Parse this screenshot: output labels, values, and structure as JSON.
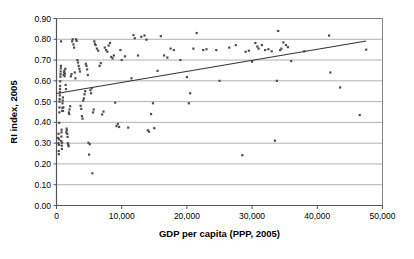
{
  "chart_data": {
    "type": "scatter",
    "title": "",
    "xlabel": "GDP per capita (PPP, 2005)",
    "ylabel": "RI index, 2005",
    "xlim": [
      0,
      50000
    ],
    "ylim": [
      0.0,
      0.9
    ],
    "xticks": [
      0,
      10000,
      20000,
      30000,
      40000,
      50000
    ],
    "xtick_labels": [
      "0",
      "10,000",
      "20,000",
      "30,000",
      "40,000",
      "50,000"
    ],
    "yticks": [
      0.0,
      0.1,
      0.2,
      0.3,
      0.4,
      0.5,
      0.6,
      0.7,
      0.8,
      0.9
    ],
    "ytick_labels": [
      "0.00",
      "0.10",
      "0.20",
      "0.30",
      "0.40",
      "0.50",
      "0.60",
      "0.70",
      "0.80",
      "0.90"
    ],
    "grid": "horizontal",
    "legend": "none",
    "marker": {
      "shape": "square",
      "size_px": 2.2,
      "color": "#4d4d4d"
    },
    "trendline": {
      "type": "linear",
      "color": "#333333",
      "x_start": 0,
      "y_start": 0.539,
      "x_end": 47500,
      "y_end": 0.792
    },
    "series": [
      {
        "name": "Countries",
        "points": [
          [
            250,
            0.325
          ],
          [
            300,
            0.3
          ],
          [
            320,
            0.345
          ],
          [
            340,
            0.262
          ],
          [
            360,
            0.247
          ],
          [
            380,
            0.292
          ],
          [
            400,
            0.318
          ],
          [
            420,
            0.398
          ],
          [
            440,
            0.448
          ],
          [
            450,
            0.472
          ],
          [
            470,
            0.5
          ],
          [
            480,
            0.512
          ],
          [
            500,
            0.53
          ],
          [
            520,
            0.545
          ],
          [
            540,
            0.56
          ],
          [
            560,
            0.575
          ],
          [
            580,
            0.598
          ],
          [
            600,
            0.62
          ],
          [
            620,
            0.632
          ],
          [
            640,
            0.645
          ],
          [
            660,
            0.66
          ],
          [
            680,
            0.672
          ],
          [
            700,
            0.79
          ],
          [
            720,
            0.31
          ],
          [
            740,
            0.332
          ],
          [
            760,
            0.352
          ],
          [
            780,
            0.365
          ],
          [
            800,
            0.288
          ],
          [
            820,
            0.272
          ],
          [
            850,
            0.302
          ],
          [
            880,
            0.455
          ],
          [
            900,
            0.47
          ],
          [
            920,
            0.492
          ],
          [
            950,
            0.505
          ],
          [
            980,
            0.52
          ],
          [
            1000,
            0.455
          ],
          [
            1050,
            0.472
          ],
          [
            1100,
            0.628
          ],
          [
            1150,
            0.64
          ],
          [
            1200,
            0.648
          ],
          [
            1250,
            0.622
          ],
          [
            1300,
            0.635
          ],
          [
            1350,
            0.658
          ],
          [
            1400,
            0.58
          ],
          [
            1450,
            0.56
          ],
          [
            1500,
            0.352
          ],
          [
            1550,
            0.37
          ],
          [
            1600,
            0.362
          ],
          [
            1650,
            0.345
          ],
          [
            1700,
            0.33
          ],
          [
            1750,
            0.3
          ],
          [
            1800,
            0.292
          ],
          [
            1850,
            0.285
          ],
          [
            1900,
            0.448
          ],
          [
            1950,
            0.44
          ],
          [
            2000,
            0.462
          ],
          [
            2100,
            0.478
          ],
          [
            2200,
            0.622
          ],
          [
            2300,
            0.632
          ],
          [
            2400,
            0.79
          ],
          [
            2500,
            0.8
          ],
          [
            2600,
            0.775
          ],
          [
            2700,
            0.76
          ],
          [
            2800,
            0.64
          ],
          [
            2900,
            0.612
          ],
          [
            3000,
            0.8
          ],
          [
            3100,
            0.792
          ],
          [
            3200,
            0.7
          ],
          [
            3300,
            0.688
          ],
          [
            3400,
            0.672
          ],
          [
            3500,
            0.658
          ],
          [
            3600,
            0.645
          ],
          [
            3700,
            0.48
          ],
          [
            3800,
            0.465
          ],
          [
            3900,
            0.43
          ],
          [
            4000,
            0.418
          ],
          [
            4100,
            0.505
          ],
          [
            4200,
            0.515
          ],
          [
            4300,
            0.535
          ],
          [
            4400,
            0.55
          ],
          [
            4500,
            0.682
          ],
          [
            4600,
            0.672
          ],
          [
            4700,
            0.655
          ],
          [
            4800,
            0.628
          ],
          [
            4900,
            0.302
          ],
          [
            5000,
            0.245
          ],
          [
            5100,
            0.295
          ],
          [
            5200,
            0.555
          ],
          [
            5300,
            0.54
          ],
          [
            5400,
            0.565
          ],
          [
            5500,
            0.155
          ],
          [
            5600,
            0.448
          ],
          [
            5700,
            0.462
          ],
          [
            5800,
            0.79
          ],
          [
            5900,
            0.778
          ],
          [
            6000,
            0.772
          ],
          [
            6200,
            0.755
          ],
          [
            6400,
            0.745
          ],
          [
            6600,
            0.672
          ],
          [
            6800,
            0.685
          ],
          [
            7000,
            0.438
          ],
          [
            7200,
            0.452
          ],
          [
            7400,
            0.76
          ],
          [
            7600,
            0.748
          ],
          [
            7800,
            0.74
          ],
          [
            8000,
            0.77
          ],
          [
            8200,
            0.782
          ],
          [
            8400,
            0.715
          ],
          [
            8600,
            0.708
          ],
          [
            8800,
            0.722
          ],
          [
            9000,
            0.495
          ],
          [
            9200,
            0.382
          ],
          [
            9400,
            0.392
          ],
          [
            9600,
            0.378
          ],
          [
            9800,
            0.748
          ],
          [
            10000,
            0.7
          ],
          [
            10500,
            0.718
          ],
          [
            11000,
            0.375
          ],
          [
            11500,
            0.612
          ],
          [
            11800,
            0.82
          ],
          [
            12000,
            0.805
          ],
          [
            12500,
            0.722
          ],
          [
            13000,
            0.812
          ],
          [
            13500,
            0.818
          ],
          [
            13800,
            0.798
          ],
          [
            14000,
            0.362
          ],
          [
            14200,
            0.355
          ],
          [
            14500,
            0.44
          ],
          [
            14800,
            0.492
          ],
          [
            15000,
            0.372
          ],
          [
            15500,
            0.648
          ],
          [
            16000,
            0.815
          ],
          [
            16500,
            0.722
          ],
          [
            17000,
            0.712
          ],
          [
            17500,
            0.755
          ],
          [
            18000,
            0.748
          ],
          [
            19000,
            0.7
          ],
          [
            20000,
            0.618
          ],
          [
            20300,
            0.492
          ],
          [
            20500,
            0.54
          ],
          [
            21000,
            0.755
          ],
          [
            21500,
            0.83
          ],
          [
            22500,
            0.748
          ],
          [
            23000,
            0.752
          ],
          [
            24500,
            0.748
          ],
          [
            25000,
            0.6
          ],
          [
            26500,
            0.76
          ],
          [
            27500,
            0.772
          ],
          [
            28500,
            0.242
          ],
          [
            29000,
            0.74
          ],
          [
            29500,
            0.745
          ],
          [
            30000,
            0.692
          ],
          [
            30500,
            0.782
          ],
          [
            30800,
            0.765
          ],
          [
            31000,
            0.755
          ],
          [
            31500,
            0.772
          ],
          [
            32000,
            0.748
          ],
          [
            32500,
            0.752
          ],
          [
            33000,
            0.742
          ],
          [
            33500,
            0.312
          ],
          [
            33800,
            0.6
          ],
          [
            34000,
            0.84
          ],
          [
            34300,
            0.748
          ],
          [
            34500,
            0.755
          ],
          [
            34800,
            0.785
          ],
          [
            35200,
            0.772
          ],
          [
            35500,
            0.762
          ],
          [
            36000,
            0.695
          ],
          [
            38000,
            0.742
          ],
          [
            41800,
            0.818
          ],
          [
            42000,
            0.64
          ],
          [
            43500,
            0.568
          ],
          [
            46500,
            0.435
          ],
          [
            47500,
            0.75
          ]
        ]
      }
    ]
  }
}
